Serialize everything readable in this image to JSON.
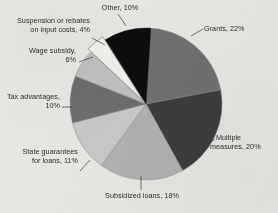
{
  "chart_data": {
    "type": "pie",
    "title": "",
    "subtitle": "",
    "xlabel": "",
    "ylabel": "",
    "legend_position": "none",
    "grid": false,
    "unit": "%",
    "categories": [
      "Grants",
      "Multiple measures",
      "Subsidized loans",
      "State guarantees for loans",
      "Tax advantages",
      "Wage subsidy",
      "Suspension or rebates on input costs",
      "Other"
    ],
    "values": [
      22,
      20,
      18,
      11,
      10,
      6,
      4,
      10
    ],
    "total": 101,
    "slices": [
      {
        "name": "Grants",
        "value": 22,
        "label": "Grants, 22%",
        "label_lines": [
          "Grants, 22%"
        ],
        "color": "#717171",
        "start_angle": 0,
        "end_angle": 79.2
      },
      {
        "name": "Multiple measures",
        "value": 20,
        "label": "Multiple measures, 20%",
        "label_lines": [
          "Multiple",
          "measures, 20%"
        ],
        "color": "#3d3d3d",
        "start_angle": 79.2,
        "end_angle": 151.2
      },
      {
        "name": "Subsidized loans",
        "value": 18,
        "label": "Subsidized loans, 18%",
        "label_lines": [
          "Subsidized loans, 18%"
        ],
        "color": "#b2b2b2",
        "start_angle": 151.2,
        "end_angle": 216.0
      },
      {
        "name": "State guarantees for loans",
        "value": 11,
        "label": "State guarantees for loans, 11%",
        "label_lines": [
          "State guarantees",
          "for loans, 11%"
        ],
        "color": "#c9c9c9",
        "start_angle": 216.0,
        "end_angle": 255.6
      },
      {
        "name": "Tax advantages",
        "value": 10,
        "label": "Tax advantages, 10%",
        "label_lines": [
          "Tax advantages,",
          "10%"
        ],
        "color": "#6e6e6e",
        "start_angle": 255.6,
        "end_angle": 291.6
      },
      {
        "name": "Wage subsidy",
        "value": 6,
        "label": "Wage subsidy, 6%",
        "label_lines": [
          "Wage subsidy,",
          "6%"
        ],
        "color": "#c1c1c1",
        "start_angle": 291.6,
        "end_angle": 313.2
      },
      {
        "name": "Suspension or rebates on input costs",
        "value": 4,
        "label": "Suspension or rebates on input costs, 4%",
        "label_lines": [
          "Suspension or rebates",
          "on input costs, 4%"
        ],
        "color": "#f2f1ed",
        "start_angle": 313.2,
        "end_angle": 327.6
      },
      {
        "name": "Other",
        "value": 10,
        "label": "Other, 10%",
        "label_lines": [
          "Other, 10%"
        ],
        "color": "#0d0d0d",
        "start_angle": 327.6,
        "end_angle": 363.6
      }
    ]
  },
  "labels": {
    "grants": "Grants, 22%",
    "multiple_measures_line1": "Multiple",
    "multiple_measures_line2": "measures, 20%",
    "subsidized_loans": "Subsidized loans, 18%",
    "state_guarantees_line1": "State guarantees",
    "state_guarantees_line2": "for loans, 11%",
    "tax_advantages_line1": "Tax advantages,",
    "tax_advantages_line2": "10%",
    "wage_subsidy_line1": "Wage subsidy,",
    "wage_subsidy_line2": "6%",
    "suspension_line1": "Suspension or rebates",
    "suspension_line2": "on input costs, 4%",
    "other": "Other, 10%"
  },
  "colors": {
    "background": "#e9e8e4",
    "text": "#2a2a2a",
    "leader_line": "#3a3a3a",
    "slice_border": "#8a8a8a"
  }
}
